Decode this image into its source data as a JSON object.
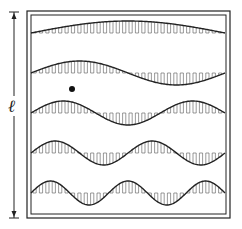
{
  "figure": {
    "length_label": "ℓ",
    "colors": {
      "ink": "#222222",
      "hatch": "#555555",
      "background": "#ffffff"
    },
    "frame": {
      "outer": [
        27,
        11,
        230,
        218
      ],
      "inner": [
        31,
        15,
        226,
        214
      ]
    },
    "arrow": {
      "x": 14,
      "y_top": 12,
      "y_bottom": 218
    },
    "label_pos": {
      "x": 8,
      "y": 96
    },
    "dot": {
      "cx": 72,
      "cy": 89,
      "r": 3
    },
    "waves": [
      {
        "mode": 1,
        "baseline": 33,
        "amplitude": 12,
        "half_wavelengths": 1
      },
      {
        "mode": 2,
        "baseline": 73,
        "amplitude": 12,
        "half_wavelengths": 2
      },
      {
        "mode": 3,
        "baseline": 113,
        "amplitude": 12,
        "half_wavelengths": 3
      },
      {
        "mode": 4,
        "baseline": 153,
        "amplitude": 12,
        "half_wavelengths": 4
      },
      {
        "mode": 5,
        "baseline": 193,
        "amplitude": 12,
        "half_wavelengths": 5
      }
    ],
    "wave_x_range": [
      31,
      225
    ]
  }
}
